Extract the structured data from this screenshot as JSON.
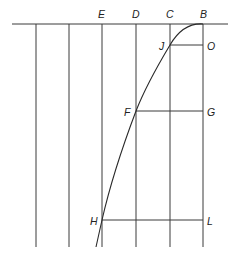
{
  "diagram": {
    "type": "geometric construction",
    "top_labels": [
      "E",
      "D",
      "C",
      "B"
    ],
    "points": {
      "B": "B",
      "C": "C",
      "D": "D",
      "E": "E",
      "J": "J",
      "O": "O",
      "F": "F",
      "G": "G",
      "H": "H",
      "L": "L"
    },
    "colors": {
      "line": "#3a3a3a",
      "background": "#ffffff"
    }
  }
}
